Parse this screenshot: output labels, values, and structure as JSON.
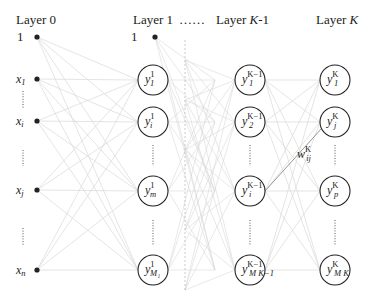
{
  "diagram": {
    "colors": {
      "edge": "#d9d9d9",
      "highlight_edge": "#8a8a8a",
      "node_stroke": "#222222",
      "text": "#222222",
      "dashed_separator": "#bdbdbd"
    },
    "layers": [
      {
        "label": "Layer 0",
        "x": 37,
        "label_x": 20,
        "bias": "1",
        "bias_y": 37
      },
      {
        "label": "Layer 1",
        "x": 153,
        "label_x": 133,
        "bias": "1",
        "bias_y": 37
      },
      {
        "label": "Layer K-1",
        "x": 250,
        "label_x": 216
      },
      {
        "label": "Layer K",
        "x": 335,
        "label_x": 316
      }
    ],
    "ellipsis_between": "……",
    "inputs": [
      {
        "base": "x",
        "sub": "1",
        "y": 79
      },
      {
        "base": "x",
        "sub": "i",
        "y": 121
      },
      {
        "base": "x",
        "sub": "j",
        "y": 190
      },
      {
        "base": "x",
        "sub": "n",
        "y": 270
      }
    ],
    "layer1_nodes": [
      {
        "base": "y",
        "sub": "1",
        "sup": "1",
        "y": 80
      },
      {
        "base": "y",
        "sub": "i",
        "sup": "1",
        "y": 122
      },
      {
        "base": "y",
        "sub": "m",
        "sup": "1",
        "y": 191
      },
      {
        "base": "y",
        "sub": "M₁",
        "sup": "1",
        "y": 270
      }
    ],
    "layerKm1_nodes": [
      {
        "base": "y",
        "sub": "1",
        "sup": "K−1",
        "y": 80
      },
      {
        "base": "y",
        "sub": "2",
        "sup": "K−1",
        "y": 122
      },
      {
        "base": "y",
        "sub": "i",
        "sup": "K−1",
        "y": 191
      },
      {
        "base": "y",
        "sub": "M_K−1",
        "sup": "K−1",
        "y": 270
      }
    ],
    "layerK_nodes": [
      {
        "base": "y",
        "sub": "1",
        "sup": "K",
        "y": 80
      },
      {
        "base": "y",
        "sub": "j",
        "sup": "K",
        "y": 122
      },
      {
        "base": "y",
        "sub": "p",
        "sup": "K",
        "y": 191
      },
      {
        "base": "y",
        "sub": "M_K",
        "sup": "K",
        "y": 270
      }
    ],
    "weight_label": {
      "base": "w",
      "sub": "ij",
      "sup": "K"
    },
    "vertical_ellipsis": "⋮"
  }
}
